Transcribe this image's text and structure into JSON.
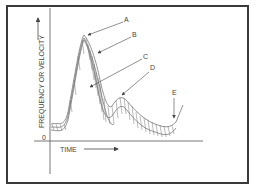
{
  "diagram": {
    "y_axis_label": "FREQUENCY OR VELOCITY",
    "x_axis_label": "TIME",
    "origin_label": "0",
    "annotations": [
      {
        "id": "A",
        "label": "A"
      },
      {
        "id": "B",
        "label": "B"
      },
      {
        "id": "C",
        "label": "C"
      },
      {
        "id": "D",
        "label": "D"
      },
      {
        "id": "E",
        "label": "E"
      }
    ],
    "colors": {
      "line": "#555555",
      "frame": "#3a3a3a",
      "background": "#ffffff"
    }
  }
}
